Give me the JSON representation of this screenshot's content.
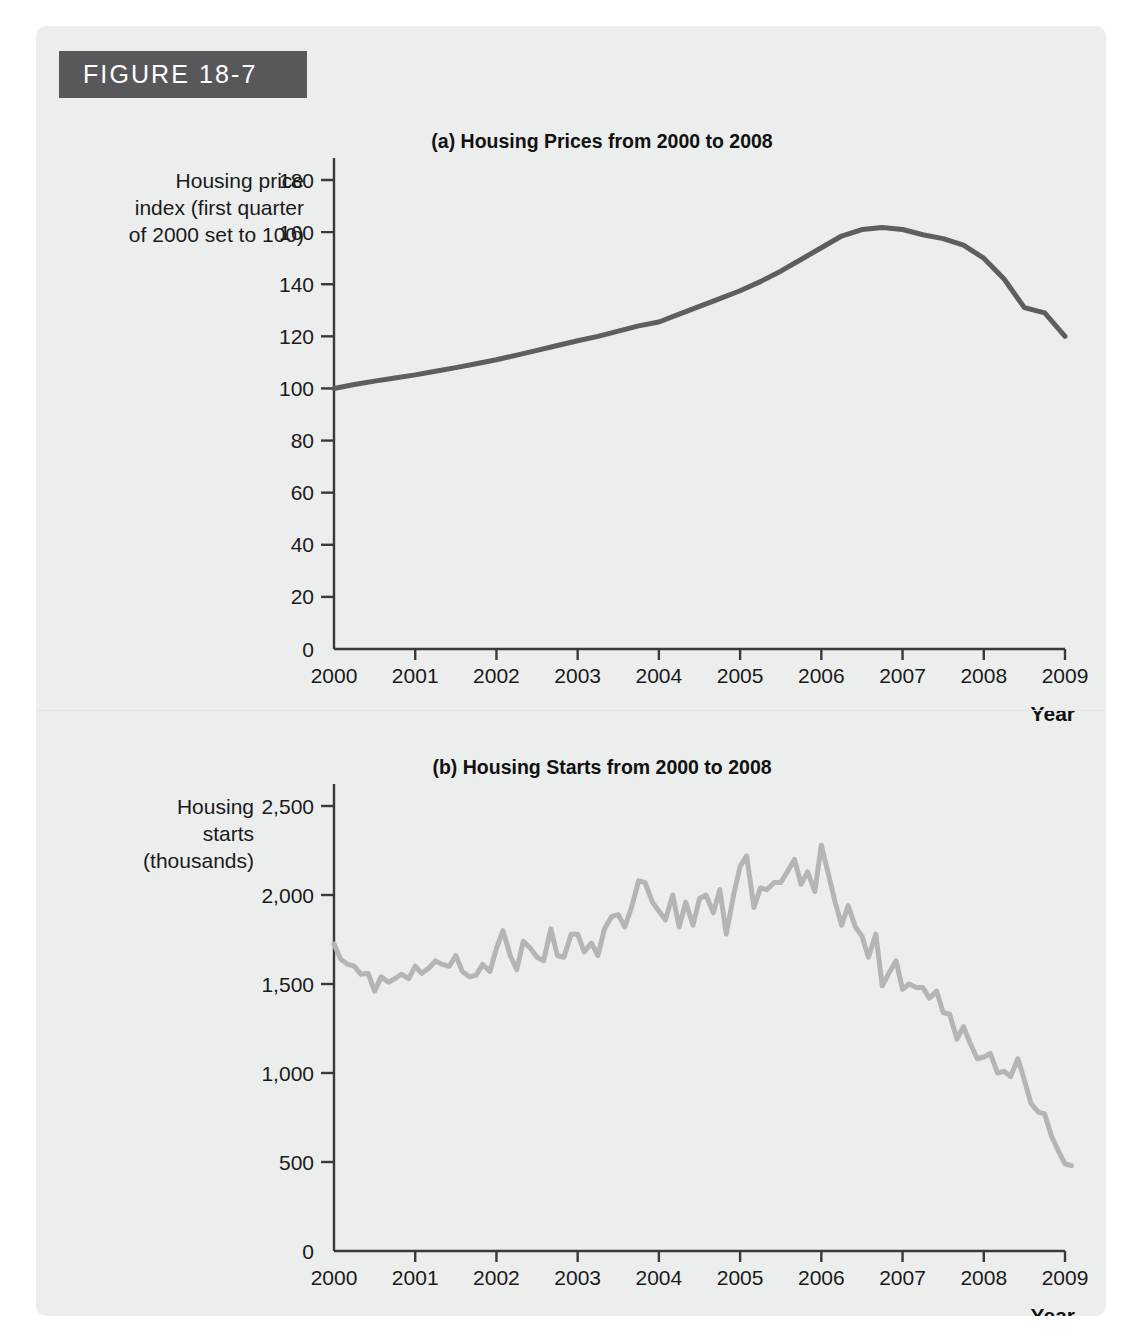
{
  "figure": {
    "banner_label": "FIGURE 18-7",
    "banner_color": "#58585a",
    "card_color": "#eceded"
  },
  "chart_data": [
    {
      "id": "panel-a",
      "type": "line",
      "title": "(a) Housing Prices from 2000 to 2008",
      "ylabel": "Housing price index (first quarter of 2000 set to 100)",
      "xlabel": "Year",
      "line_color": "#5e5e5e",
      "line_width": 5,
      "xlim": [
        2000,
        2009
      ],
      "ylim": [
        0,
        180
      ],
      "grid": false,
      "legend": "none",
      "xticks": [
        "2000",
        "2001",
        "2002",
        "2003",
        "2004",
        "2005",
        "2006",
        "2007",
        "2008",
        "2009"
      ],
      "yticks": [
        "0",
        "20",
        "40",
        "60",
        "80",
        "100",
        "120",
        "140",
        "160",
        "180"
      ],
      "x": [
        2000.0,
        2000.25,
        2000.5,
        2000.75,
        2001.0,
        2001.25,
        2001.5,
        2001.75,
        2002.0,
        2002.25,
        2002.5,
        2002.75,
        2003.0,
        2003.25,
        2003.5,
        2003.75,
        2004.0,
        2004.25,
        2004.5,
        2004.75,
        2005.0,
        2005.25,
        2005.5,
        2005.75,
        2006.0,
        2006.25,
        2006.5,
        2006.75,
        2007.0,
        2007.25,
        2007.5,
        2007.75,
        2008.0,
        2008.25,
        2008.5,
        2008.75,
        2009.0
      ],
      "values": [
        100.0,
        101.5,
        102.8,
        104.0,
        105.2,
        106.6,
        108.0,
        109.5,
        111.0,
        112.8,
        114.6,
        116.5,
        118.3,
        120.0,
        122.0,
        124.0,
        125.5,
        128.5,
        131.5,
        134.5,
        137.5,
        141.0,
        145.0,
        149.5,
        154.0,
        158.5,
        161.0,
        161.8,
        161.0,
        159.0,
        157.5,
        155.0,
        150.0,
        142.0,
        131.0,
        129.0,
        120.0
      ]
    },
    {
      "id": "panel-b",
      "type": "line",
      "title": "(b) Housing Starts from 2000 to 2008",
      "ylabel": "Housing starts (thousands)",
      "xlabel": "Year",
      "line_color": "#b5b5b5",
      "line_width": 5,
      "xlim": [
        2000,
        2009
      ],
      "ylim": [
        0,
        2500
      ],
      "grid": false,
      "legend": "none",
      "xticks": [
        "2000",
        "2001",
        "2002",
        "2003",
        "2004",
        "2005",
        "2006",
        "2007",
        "2008",
        "2009"
      ],
      "yticks": [
        "0",
        "500",
        "1,000",
        "1,500",
        "2,000",
        "2,500"
      ],
      "x": [
        2000.0,
        2000.08,
        2000.17,
        2000.25,
        2000.33,
        2000.42,
        2000.5,
        2000.58,
        2000.67,
        2000.75,
        2000.83,
        2000.92,
        2001.0,
        2001.08,
        2001.17,
        2001.25,
        2001.33,
        2001.42,
        2001.5,
        2001.58,
        2001.67,
        2001.75,
        2001.83,
        2001.92,
        2002.0,
        2002.08,
        2002.17,
        2002.25,
        2002.33,
        2002.42,
        2002.5,
        2002.58,
        2002.67,
        2002.75,
        2002.83,
        2002.92,
        2003.0,
        2003.08,
        2003.17,
        2003.25,
        2003.33,
        2003.42,
        2003.5,
        2003.58,
        2003.67,
        2003.75,
        2003.83,
        2003.92,
        2004.0,
        2004.08,
        2004.17,
        2004.25,
        2004.33,
        2004.42,
        2004.5,
        2004.58,
        2004.67,
        2004.75,
        2004.83,
        2004.92,
        2005.0,
        2005.08,
        2005.17,
        2005.25,
        2005.33,
        2005.42,
        2005.5,
        2005.58,
        2005.67,
        2005.75,
        2005.83,
        2005.92,
        2006.0,
        2006.08,
        2006.17,
        2006.25,
        2006.33,
        2006.42,
        2006.5,
        2006.58,
        2006.67,
        2006.75,
        2006.83,
        2006.92,
        2007.0,
        2007.08,
        2007.17,
        2007.25,
        2007.33,
        2007.42,
        2007.5,
        2007.58,
        2007.67,
        2007.75,
        2007.83,
        2007.92,
        2008.0,
        2008.08,
        2008.17,
        2008.25,
        2008.33,
        2008.42,
        2008.5,
        2008.58,
        2008.67,
        2008.75,
        2008.83,
        2008.92,
        2009.0,
        2009.08
      ],
      "values": [
        1725,
        1640,
        1610,
        1600,
        1555,
        1560,
        1460,
        1540,
        1510,
        1530,
        1555,
        1530,
        1600,
        1560,
        1590,
        1630,
        1610,
        1600,
        1660,
        1570,
        1540,
        1550,
        1610,
        1570,
        1700,
        1800,
        1660,
        1580,
        1740,
        1700,
        1650,
        1630,
        1810,
        1660,
        1650,
        1780,
        1780,
        1680,
        1730,
        1660,
        1810,
        1880,
        1890,
        1820,
        1940,
        2080,
        2070,
        1960,
        1910,
        1860,
        2000,
        1820,
        1960,
        1830,
        1980,
        2000,
        1900,
        2030,
        1780,
        2000,
        2160,
        2220,
        1930,
        2040,
        2030,
        2070,
        2070,
        2130,
        2200,
        2060,
        2130,
        2020,
        2280,
        2130,
        1960,
        1830,
        1940,
        1820,
        1770,
        1650,
        1780,
        1490,
        1560,
        1630,
        1470,
        1500,
        1480,
        1480,
        1420,
        1460,
        1340,
        1330,
        1190,
        1260,
        1170,
        1080,
        1090,
        1110,
        1000,
        1010,
        980,
        1080,
        960,
        830,
        780,
        770,
        650,
        560,
        490,
        480
      ]
    }
  ]
}
